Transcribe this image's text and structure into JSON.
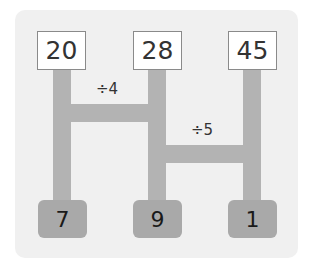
{
  "diagram": {
    "top_numbers": [
      "20",
      "28",
      "45"
    ],
    "bottom_numbers": [
      "7",
      "9",
      "1"
    ],
    "operations": [
      {
        "label": "÷4",
        "connects": [
          "20",
          "28"
        ]
      },
      {
        "label": "÷5",
        "connects": [
          "28",
          "45"
        ]
      }
    ],
    "colors": {
      "panel": "#f0f0f0",
      "bars": "#b3b3b3",
      "top_box": "#ffffff",
      "bottom_box": "#a9a9a9"
    }
  }
}
